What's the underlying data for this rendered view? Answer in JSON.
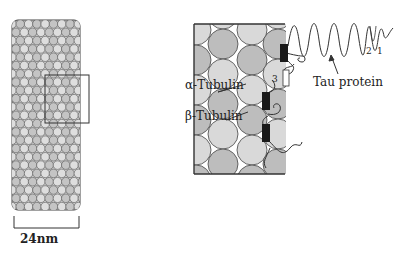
{
  "diagram": {
    "microtubule": {
      "diameter_label": "24nm"
    },
    "zoomed_view": {
      "labels": {
        "alpha_tubulin": "α-Tubulin",
        "beta_tubulin": "β-Tubulin",
        "tau_protein": "Tau protein"
      },
      "repeat_markers": [
        "2",
        "1",
        "3"
      ]
    },
    "colors": {
      "line": "#333333",
      "tubulin_light": "#d9d9d9",
      "tubulin_dark": "#bdbdbd",
      "binding_domain": "#1a1a1a"
    }
  }
}
